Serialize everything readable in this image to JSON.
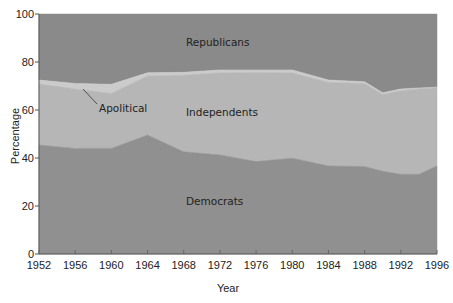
{
  "chart_data": {
    "type": "area",
    "stacked": true,
    "title": "",
    "xlabel": "Year",
    "ylabel": "Percentage",
    "ylim": [
      0,
      100
    ],
    "xlim": [
      1952,
      1996
    ],
    "grid": false,
    "legend": "inline labels",
    "x_ticks": [
      1952,
      1956,
      1960,
      1964,
      1968,
      1972,
      1976,
      1980,
      1984,
      1988,
      1992,
      1996
    ],
    "y_ticks": [
      0,
      20,
      40,
      60,
      80,
      100
    ],
    "x": [
      1952,
      1956,
      1960,
      1964,
      1968,
      1972,
      1976,
      1980,
      1984,
      1988,
      1990,
      1992,
      1994,
      1996
    ],
    "boundaries": {
      "democrats_top": [
        45.4,
        44.0,
        44.0,
        49.6,
        42.6,
        41.3,
        38.5,
        39.9,
        36.7,
        36.4,
        34.5,
        33.2,
        33.2,
        36.7
      ],
      "independents_top": [
        70.8,
        68.8,
        66.9,
        74.2,
        74.5,
        75.5,
        75.6,
        75.5,
        71.5,
        71.0,
        66.5,
        68.0,
        68.8,
        69.3
      ],
      "apolitical_top": [
        72.5,
        71.1,
        70.7,
        75.5,
        75.7,
        76.7,
        76.7,
        76.7,
        72.5,
        71.8,
        67.2,
        68.8,
        69.2,
        69.5
      ]
    },
    "series": [
      {
        "name": "Democrats",
        "color": "#909090",
        "values": [
          45.4,
          44.0,
          44.0,
          49.6,
          42.6,
          41.3,
          38.5,
          39.9,
          36.7,
          36.4,
          34.5,
          33.2,
          33.2,
          36.7
        ]
      },
      {
        "name": "Independents",
        "color": "#b6b6b6",
        "values": [
          25.4,
          24.8,
          22.9,
          24.6,
          31.9,
          34.2,
          37.1,
          35.6,
          34.8,
          34.6,
          32.0,
          34.8,
          35.6,
          32.6
        ]
      },
      {
        "name": "Apolitical",
        "color": "#cbcbcb",
        "values": [
          1.7,
          2.3,
          3.8,
          1.3,
          1.2,
          1.2,
          1.1,
          1.2,
          1.0,
          0.8,
          0.7,
          0.8,
          0.4,
          0.2
        ]
      },
      {
        "name": "Republicans",
        "color": "#8a8a8a",
        "values": [
          27.5,
          28.9,
          29.3,
          24.5,
          24.3,
          23.3,
          23.3,
          23.3,
          27.5,
          28.2,
          32.8,
          31.2,
          30.8,
          30.5
        ]
      }
    ],
    "annotations": [
      {
        "text": "Republicans",
        "x": 1970,
        "y": 88
      },
      {
        "text": "Independents",
        "x": 1970,
        "y": 58
      },
      {
        "text": "Democrats",
        "x": 1970,
        "y": 21
      },
      {
        "text": "Apolitical",
        "x": 1957,
        "y": 60,
        "leader_line": true
      }
    ]
  },
  "labels": {
    "xlabel": "Year",
    "ylabel": "Percentage",
    "republicans": "Republicans",
    "independents": "Independents",
    "democrats": "Democrats",
    "apolitical": "Apolitical",
    "x_ticks": [
      "1952",
      "1956",
      "1960",
      "1964",
      "1968",
      "1972",
      "1976",
      "1980",
      "1984",
      "1988",
      "1992",
      "1996"
    ],
    "y_ticks": [
      "0",
      "20",
      "40",
      "60",
      "80",
      "100"
    ]
  }
}
